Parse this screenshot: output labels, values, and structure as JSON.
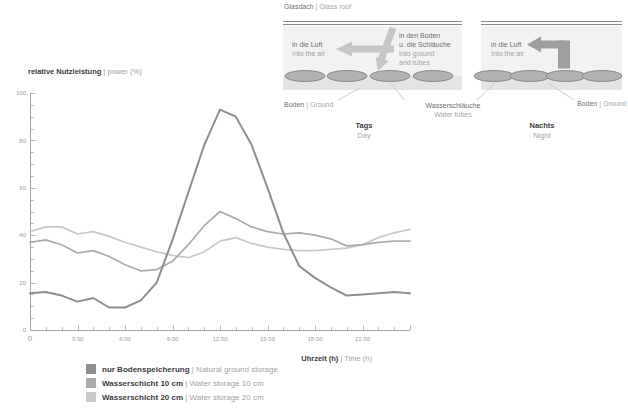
{
  "y_axis_title": {
    "de": "relative Nutzleistung",
    "en": "| power (%)"
  },
  "x_axis_title": {
    "de": "Uhrzeit (h)",
    "en": "| Time (h)"
  },
  "chart_data": {
    "type": "line",
    "title": "",
    "xlabel": "Uhrzeit (h) | Time (h)",
    "ylabel": "relative Nutzleistung | power (%)",
    "xlim_hours": [
      0,
      24
    ],
    "ylim": [
      0,
      100
    ],
    "grid": false,
    "legend_position": "bottom-left",
    "x_tick_minor_step_hours": 1,
    "y_tick_minor_step": 5,
    "x_ticks": [
      {
        "h": 0,
        "label": "0"
      },
      {
        "h": 3,
        "label": "3:00"
      },
      {
        "h": 6,
        "label": "6:00"
      },
      {
        "h": 9,
        "label": "9:00"
      },
      {
        "h": 12,
        "label": "12:00"
      },
      {
        "h": 15,
        "label": "15:00"
      },
      {
        "h": 18,
        "label": "18:00"
      },
      {
        "h": 21,
        "label": "21:00"
      }
    ],
    "y_ticks": [
      {
        "v": 0,
        "label": "0"
      },
      {
        "v": 20,
        "label": "20"
      },
      {
        "v": 40,
        "label": "40"
      },
      {
        "v": 60,
        "label": "60"
      },
      {
        "v": 80,
        "label": "80"
      },
      {
        "v": 100,
        "label": "100"
      }
    ],
    "x_hours": [
      0,
      1,
      2,
      3,
      4,
      5,
      6,
      7,
      8,
      9,
      10,
      11,
      12,
      13,
      14,
      15,
      16,
      17,
      18,
      19,
      20,
      21,
      22,
      23,
      24
    ],
    "series": [
      {
        "id": "ground",
        "name_de": "nur Bodenspeicherung",
        "name_en": "| Natural ground storage",
        "color": "#8e8e8e",
        "values": [
          15.5,
          16,
          14.5,
          12,
          13.5,
          9.5,
          9.5,
          12.5,
          20,
          38,
          58,
          78,
          93,
          90,
          78,
          60,
          41,
          27,
          22,
          18,
          14.5,
          15,
          15.5,
          16,
          15.5
        ]
      },
      {
        "id": "water10",
        "name_de": "Wasserschicht 10 cm",
        "name_en": "| Water storage 10 cm",
        "color": "#ababab",
        "values": [
          37,
          38,
          36,
          32.5,
          33.5,
          31,
          27.5,
          25,
          25.5,
          29,
          36,
          44,
          50,
          47,
          43.5,
          41.5,
          40.5,
          41,
          40,
          38.5,
          35.5,
          36,
          37,
          37.5,
          37.5
        ]
      },
      {
        "id": "water20",
        "name_de": "Wasserschicht 20 cm",
        "name_en": "| Water storage 20 cm",
        "color": "#c9c9c9",
        "values": [
          41.5,
          43.5,
          43.5,
          40.5,
          41.5,
          39.5,
          37,
          35,
          33,
          31.5,
          30.5,
          33,
          37.5,
          39,
          36.5,
          35,
          34,
          33.5,
          33.5,
          34,
          34.5,
          36,
          39,
          41,
          42.5
        ]
      }
    ]
  },
  "diagrams": {
    "glass_roof_label": {
      "de": "Glasdach",
      "en": "| Glass roof"
    },
    "day": {
      "caption": {
        "de": "Tags",
        "en": "Day"
      },
      "air_arrow": {
        "de": "in die Luft",
        "en": "Into the air"
      },
      "ground_arrow": {
        "de1": "in den Boden",
        "de2": "u. die Schläuche",
        "en1": "Into ground",
        "en2": "and tubes"
      },
      "ground_label": {
        "de": "Boden",
        "en": "| Ground"
      }
    },
    "water_tubes_label": {
      "de": "Wasserschläuche",
      "en": "Water tubes"
    },
    "night": {
      "caption": {
        "de": "Nachts",
        "en": "Night"
      },
      "air_arrow": {
        "de": "in die Luft",
        "en": "Into the air"
      },
      "ground_label": {
        "de": "Boden",
        "en": "| Ground"
      }
    }
  }
}
